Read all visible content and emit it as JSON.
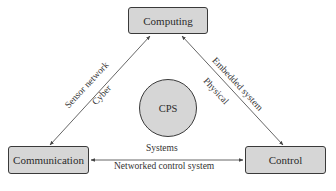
{
  "diagram": {
    "nodes": {
      "computing": "Computing",
      "communication": "Communication",
      "control": "Control",
      "center": "CPS"
    },
    "edges": {
      "communication_computing": {
        "outer_label": "Sensor network",
        "inner_label": "Cyber"
      },
      "computing_control": {
        "outer_label": "Embedded system",
        "inner_label": "Physical"
      },
      "communication_control": {
        "top_label": "Systems",
        "bottom_label": "Networked control system"
      }
    },
    "colors": {
      "node_fill": "#d6d6d6",
      "node_border": "#3a3a3a",
      "edge_line": "#555555",
      "background": "#ffffff"
    }
  }
}
